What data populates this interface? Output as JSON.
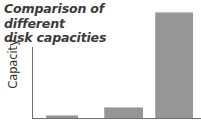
{
  "chart_data": {
    "type": "bar",
    "title": "Comparison of different\ndisk capacities",
    "title_line1": "Comparison of different",
    "title_line2": "disk capacities",
    "xlabel": "",
    "ylabel": "Capacity",
    "categories": [
      "",
      "",
      ""
    ],
    "values": [
      1,
      10,
      100
    ],
    "ylim": [
      0,
      108
    ],
    "grid": false,
    "legend": false,
    "bar_color": "#969696",
    "axis_color": "#6e6e6e",
    "title_color": "#3b3b3b",
    "background_color": "#ffffff",
    "bars": [
      {
        "label": "",
        "value": 1,
        "left_px": 46,
        "width_px": 32,
        "height_px": 3
      },
      {
        "label": "",
        "value": 10,
        "left_px": 104,
        "width_px": 39,
        "height_px": 11
      },
      {
        "label": "",
        "value": 100,
        "left_px": 155,
        "width_px": 38,
        "height_px": 106
      }
    ]
  }
}
